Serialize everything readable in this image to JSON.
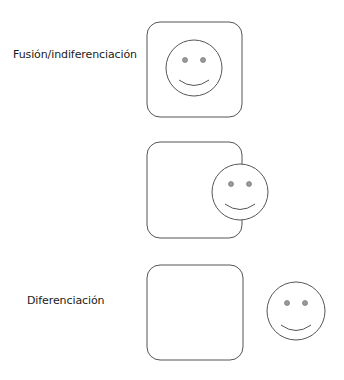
{
  "diagram": {
    "rows": [
      {
        "label": "Fusión/indiferenciación",
        "relation": "face-inside-box"
      },
      {
        "label": "",
        "relation": "face-overlapping-box-edge"
      },
      {
        "label": "Diferenciación",
        "relation": "face-outside-box"
      }
    ]
  },
  "colors": {
    "stroke": "#555555",
    "eye_fill": "#9a9a9a",
    "background": "#ffffff",
    "text": "#1a1a1a"
  }
}
